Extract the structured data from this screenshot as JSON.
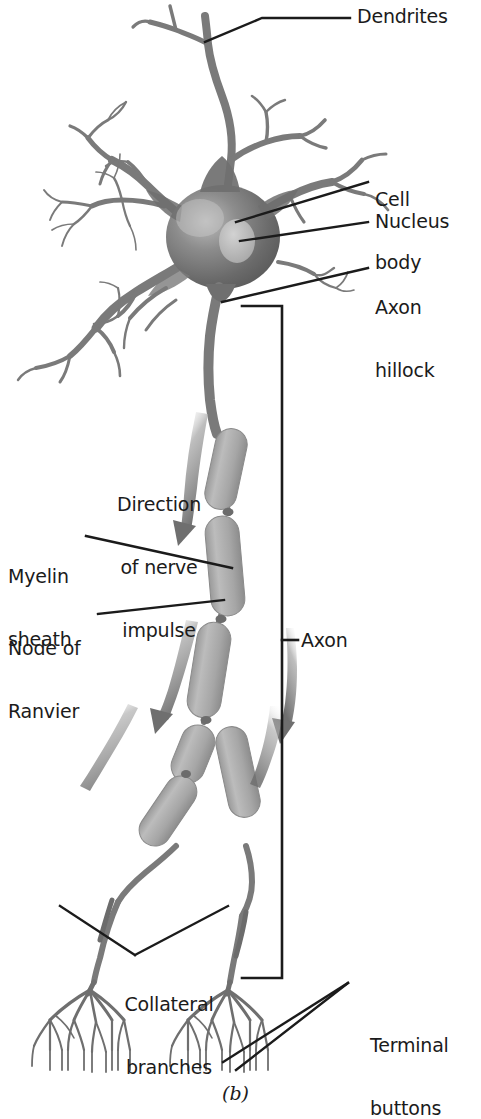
{
  "figure": {
    "type": "anatomical-diagram",
    "caption": "(b)",
    "background_color": "#ffffff",
    "text_color": "#1b1b1b",
    "soma_color": "#6e6e6e",
    "nucleus_color": "#b9b9b9",
    "myelin_color": "#a9a9a9",
    "dendrite_color": "#7a7a7a",
    "leader_line_color": "#1b1b1b"
  },
  "labels": {
    "dendrites": "Dendrites",
    "cell_body": "Cell\nbody",
    "nucleus": "Nucleus",
    "axon_hillock": "Axon\nhillock",
    "direction_of_nerve_impulse": "Direction\nof nerve\nimpulse",
    "myelin_sheath": "Myelin\nsheath",
    "node_of_ranvier": "Node of\nRanvier",
    "axon": "Axon",
    "collateral_branches": "Collateral\nbranches",
    "terminal_buttons": "Terminal\nbuttons"
  },
  "label_lines": {
    "cell_body_line1": "Cell",
    "cell_body_line2": "body",
    "axon_hillock_line1": "Axon",
    "axon_hillock_line2": "hillock",
    "direction_line1": "Direction",
    "direction_line2": "of nerve",
    "direction_line3": "impulse",
    "myelin_line1": "Myelin",
    "myelin_line2": "sheath",
    "node_line1": "Node of",
    "node_line2": "Ranvier",
    "collateral_line1": "Collateral",
    "collateral_line2": "branches",
    "terminal_line1": "Terminal",
    "terminal_line2": "buttons"
  }
}
